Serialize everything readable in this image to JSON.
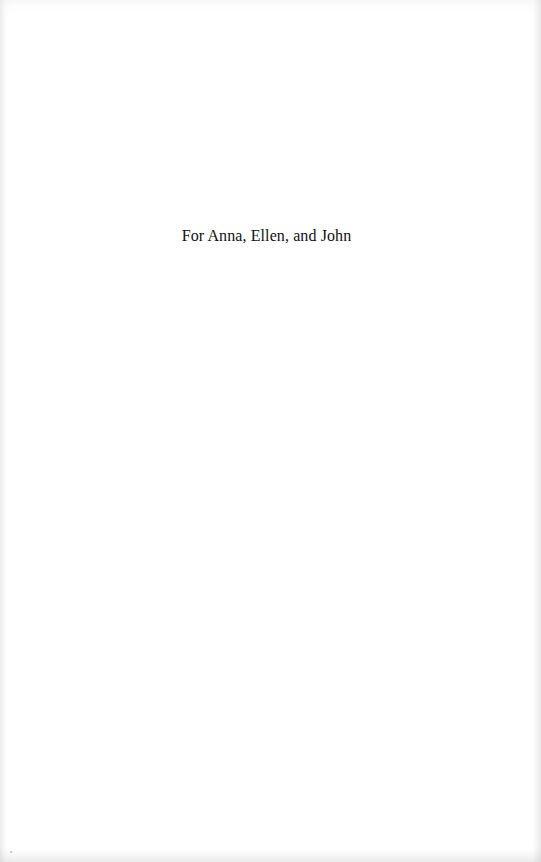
{
  "page": {
    "type": "dedication",
    "dedication_text": "For Anna, Ellen, and John",
    "background_color": "#ffffff",
    "text_color": "#111111"
  }
}
